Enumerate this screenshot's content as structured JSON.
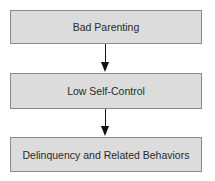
{
  "diagram": {
    "nodes": [
      {
        "id": "bad-parenting",
        "label": "Bad Parenting"
      },
      {
        "id": "low-self-control",
        "label": "Low Self-Control"
      },
      {
        "id": "delinquency",
        "label": "Delinquency and Related Behaviors"
      }
    ],
    "edges": [
      {
        "from": "bad-parenting",
        "to": "low-self-control"
      },
      {
        "from": "low-self-control",
        "to": "delinquency"
      }
    ],
    "colors": {
      "box_fill": "#dcdcdc",
      "box_border": "#8a8a8a",
      "arrow": "#111111"
    }
  }
}
